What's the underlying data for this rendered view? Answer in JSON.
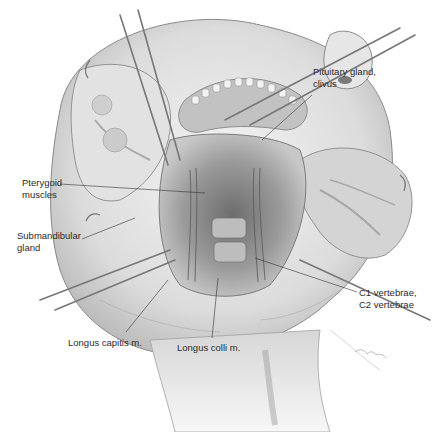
{
  "figure": {
    "background": "#ffffff",
    "ink_color": "#333333",
    "labels": [
      {
        "id": "pituitary",
        "text": "Pituitary gland,\nclivus",
        "x": 313,
        "y": 66
      },
      {
        "id": "pterygoid",
        "text": "Pterygoid\nmuscles",
        "x": 22,
        "y": 177
      },
      {
        "id": "submandibular",
        "text": "Submandibular\ngland",
        "x": 17,
        "y": 230
      },
      {
        "id": "c1c2",
        "text": "C1 vertebrae,\nC2 vertebrae",
        "x": 359,
        "y": 287
      },
      {
        "id": "longus_capitis",
        "text": "Longus capitis m.",
        "x": 68,
        "y": 337
      },
      {
        "id": "longus_colli",
        "text": "Longus colli m.",
        "x": 177,
        "y": 342
      }
    ],
    "leader_lines": [
      {
        "id": "pituitary",
        "x1": 312,
        "y1": 95,
        "x2": 262,
        "y2": 140
      },
      {
        "id": "pterygoid",
        "x1": 60,
        "y1": 184,
        "x2": 205,
        "y2": 193
      },
      {
        "id": "submandibular",
        "x1": 82,
        "y1": 239,
        "x2": 135,
        "y2": 218
      },
      {
        "id": "c1c2",
        "x1": 357,
        "y1": 292,
        "x2": 255,
        "y2": 258
      },
      {
        "id": "longus_capitis",
        "x1": 126,
        "y1": 332,
        "x2": 168,
        "y2": 280
      },
      {
        "id": "longus_colli",
        "x1": 212,
        "y1": 338,
        "x2": 218,
        "y2": 278
      }
    ]
  }
}
